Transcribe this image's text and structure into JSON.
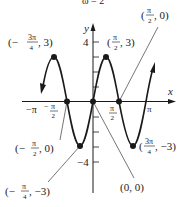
{
  "caption_fragment": "ω = 2",
  "axes": {
    "x_label": "x",
    "y_label": "y",
    "y_tick_top": "4",
    "y_tick_bottom": "−4",
    "x_tick_labels": {
      "neg_pi": "−π",
      "neg_half_pi_num": "π",
      "neg_half_pi_den": "2",
      "half_pi_num": "π",
      "half_pi_den": "2",
      "pi": "π"
    }
  },
  "points": {
    "max_left": {
      "prefix": "(−",
      "num": "3π",
      "den": "4",
      "suffix": ", 3)"
    },
    "max_right": {
      "prefix": "(",
      "num": "π",
      "den": "2",
      "suffix": ", 3)"
    },
    "zero_right": {
      "prefix": "(",
      "num": "π",
      "den": "2",
      "suffix": ", 0)"
    },
    "zero_left": {
      "prefix": "(−",
      "num": "π",
      "den": "2",
      "suffix": ", 0)"
    },
    "min_left": {
      "prefix": "(−",
      "num": "π",
      "den": "4",
      "suffix": ", −3)"
    },
    "min_right": {
      "prefix": "(",
      "num": "3π",
      "den": "4",
      "suffix": ", −3)"
    },
    "origin": {
      "label": "(0, 0)"
    }
  },
  "colors": {
    "ink": "#1a1a1a",
    "background": "#ffffff"
  }
}
